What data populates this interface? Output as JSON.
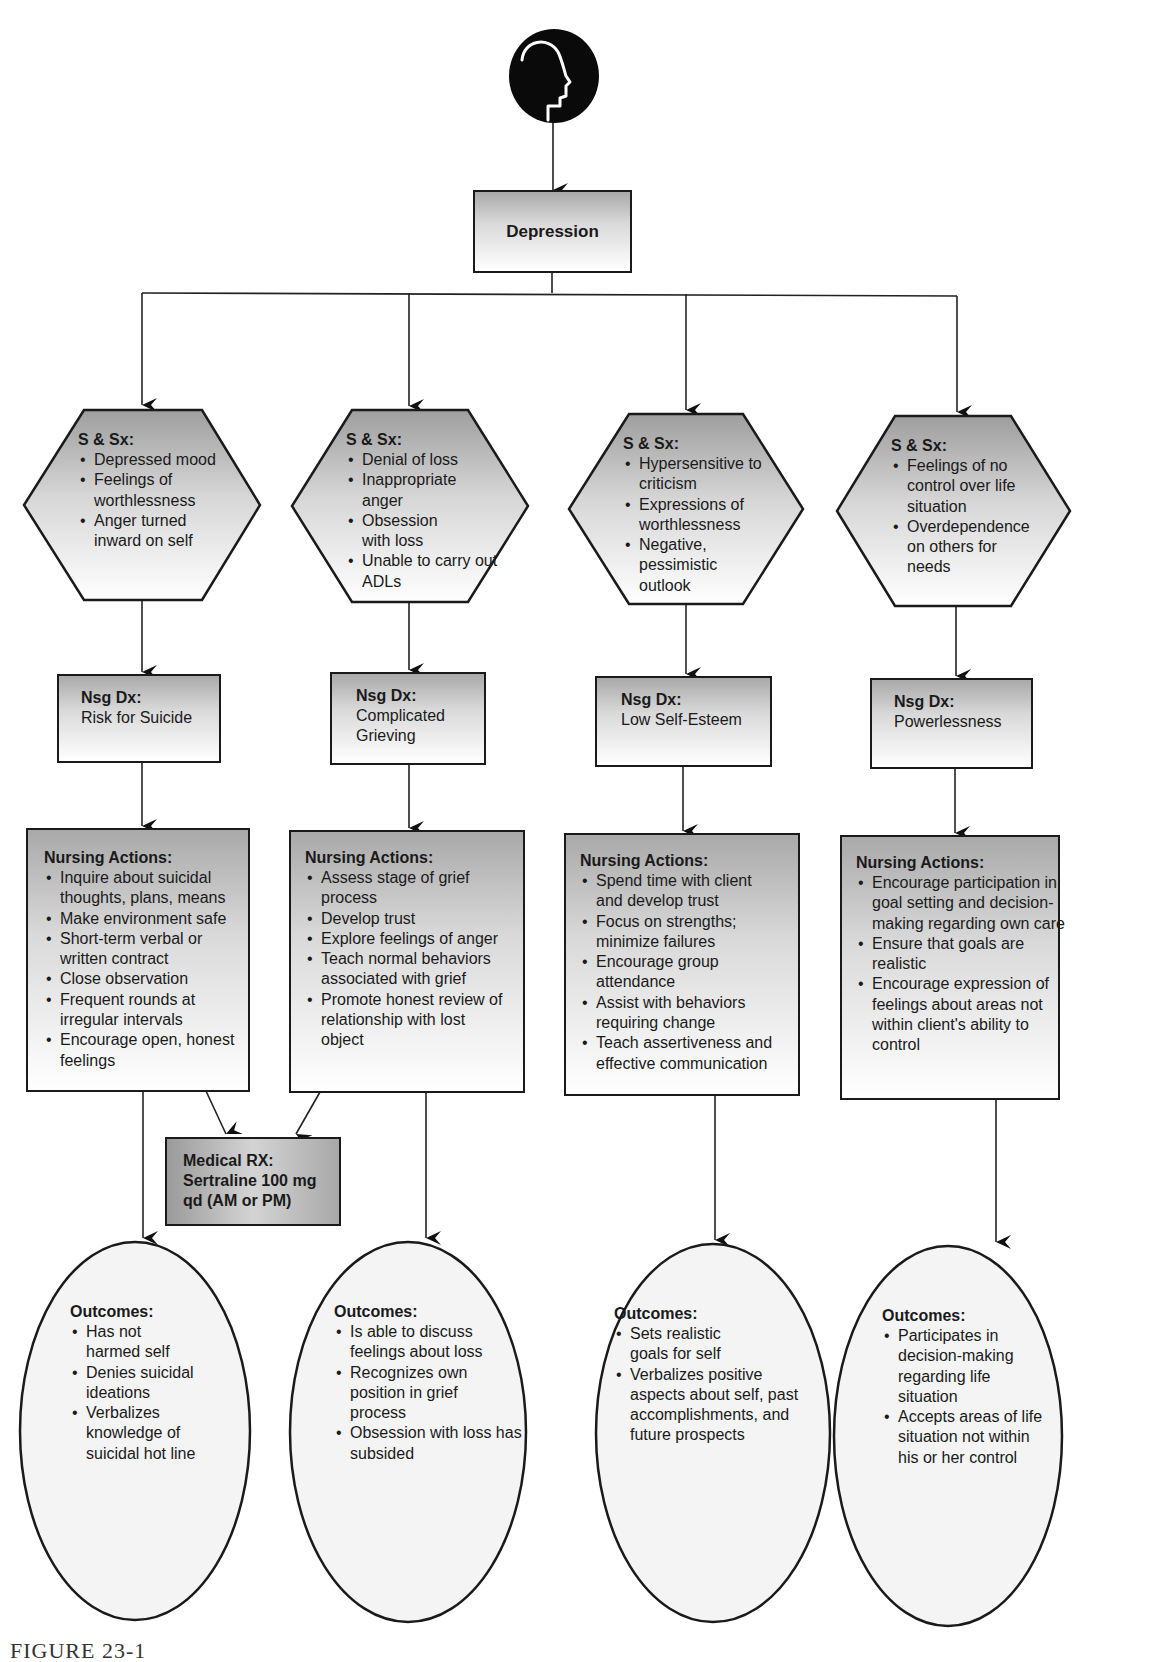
{
  "root": {
    "icon": "head-profile-icon",
    "title": "Depression"
  },
  "columns": [
    {
      "signs": {
        "title": "S & Sx:",
        "items": [
          "Depressed mood",
          "Feelings of worthlessness",
          "Anger turned inward on self"
        ]
      },
      "diagnosis": {
        "title": "Nsg Dx:",
        "value": "Risk for Suicide"
      },
      "actions": {
        "title": "Nursing Actions:",
        "items": [
          "Inquire about suicidal thoughts, plans, means",
          "Make environment safe",
          "Short-term verbal or written contract",
          "Close observation",
          "Frequent rounds at irregular intervals",
          "Encourage open, honest feelings"
        ]
      },
      "outcomes": {
        "title": "Outcomes:",
        "items": [
          "Has not harmed self",
          "Denies suicidal ideations",
          "Verbalizes knowledge of suicidal hot line"
        ]
      }
    },
    {
      "signs": {
        "title": "S & Sx:",
        "items": [
          "Denial of loss",
          "Inappropriate anger",
          "Obsession with loss",
          "Unable to carry out ADLs"
        ]
      },
      "diagnosis": {
        "title": "Nsg Dx:",
        "value": "Complicated Grieving"
      },
      "actions": {
        "title": "Nursing Actions:",
        "items": [
          "Assess stage of grief process",
          "Develop trust",
          "Explore feelings of anger",
          "Teach normal behaviors associated with grief",
          "Promote honest review of relationship with lost object"
        ]
      },
      "outcomes": {
        "title": "Outcomes:",
        "items": [
          "Is able to discuss feelings about loss",
          "Recognizes own position in grief process",
          "Obsession with loss has subsided"
        ]
      }
    },
    {
      "signs": {
        "title": "S & Sx:",
        "items": [
          "Hypersensitive to criticism",
          "Expressions of worthlessness",
          "Negative, pessimistic outlook"
        ]
      },
      "diagnosis": {
        "title": "Nsg Dx:",
        "value": "Low Self-Esteem"
      },
      "actions": {
        "title": "Nursing Actions:",
        "items": [
          "Spend time with client and develop trust",
          "Focus on strengths; minimize failures",
          "Encourage group attendance",
          "Assist with behaviors requiring change",
          "Teach assertiveness and effective communication"
        ]
      },
      "outcomes": {
        "title": "Outcomes:",
        "items": [
          "Sets realistic goals for self",
          "Verbalizes positive aspects about self, past accomplishments, and future prospects"
        ]
      }
    },
    {
      "signs": {
        "title": "S & Sx:",
        "items": [
          "Feelings of no control over life situation",
          "Overdependence on others for needs"
        ]
      },
      "diagnosis": {
        "title": "Nsg Dx:",
        "value": "Powerlessness"
      },
      "actions": {
        "title": "Nursing Actions:",
        "items": [
          "Encourage participation in goal setting and decision-making regarding own care",
          "Ensure that goals are realistic",
          "Encourage expression of feelings about areas not within client's ability to control"
        ]
      },
      "outcomes": {
        "title": "Outcomes:",
        "items": [
          "Participates in decision-making regarding life situation",
          "Accepts areas of life situation not within his or her control"
        ]
      }
    }
  ],
  "medical_rx": {
    "title": "Medical RX:",
    "lines": [
      "Sertraline 100 mg",
      "qd (AM or PM)"
    ]
  },
  "caption": "FIGURE 23-1"
}
